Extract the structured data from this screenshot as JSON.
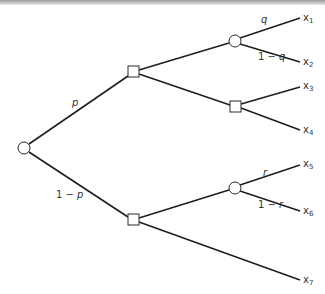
{
  "diagram": {
    "type": "decision-tree",
    "colors": {
      "line": "#1e1e1e",
      "text": "#333333",
      "node_fill": "#ffffff"
    },
    "nodes": [
      {
        "id": "root",
        "kind": "chance",
        "x": 24,
        "y": 148
      },
      {
        "id": "d1",
        "kind": "decision",
        "x": 133,
        "y": 72
      },
      {
        "id": "d2",
        "kind": "decision",
        "x": 133,
        "y": 220
      },
      {
        "id": "c1",
        "kind": "chance",
        "x": 235,
        "y": 41
      },
      {
        "id": "d3",
        "kind": "decision",
        "x": 235,
        "y": 106
      },
      {
        "id": "c2",
        "kind": "chance",
        "x": 235,
        "y": 188
      }
    ],
    "edges": [
      {
        "from": "root",
        "to": "d1",
        "label": "p"
      },
      {
        "from": "root",
        "to": "d2",
        "label": "1 − p"
      },
      {
        "from": "d1",
        "to": "c1",
        "label": ""
      },
      {
        "from": "d1",
        "to": "d3",
        "label": ""
      },
      {
        "from": "d2",
        "to": "c2",
        "label": ""
      },
      {
        "from": "d2",
        "to": "x7",
        "label": ""
      },
      {
        "from": "c1",
        "to": "x1",
        "label": "q"
      },
      {
        "from": "c1",
        "to": "x2",
        "label": "1 − q"
      },
      {
        "from": "d3",
        "to": "x3",
        "label": ""
      },
      {
        "from": "d3",
        "to": "x4",
        "label": ""
      },
      {
        "from": "c2",
        "to": "x5",
        "label": "r"
      },
      {
        "from": "c2",
        "to": "x6",
        "label": "1 − r"
      }
    ],
    "probabilities": {
      "p": "p",
      "one_minus_p_prefix": "1 − ",
      "one_minus_p_var": "p",
      "q": "q",
      "one_minus_q_prefix": "1 − ",
      "one_minus_q_var": "q",
      "r": "r",
      "one_minus_r_prefix": "1 − ",
      "one_minus_r_var": "r"
    },
    "outcomes": [
      {
        "base": "x",
        "sub": "1"
      },
      {
        "base": "x",
        "sub": "2"
      },
      {
        "base": "x",
        "sub": "3"
      },
      {
        "base": "x",
        "sub": "4"
      },
      {
        "base": "x",
        "sub": "5"
      },
      {
        "base": "x",
        "sub": "6"
      },
      {
        "base": "x",
        "sub": "7"
      }
    ]
  }
}
